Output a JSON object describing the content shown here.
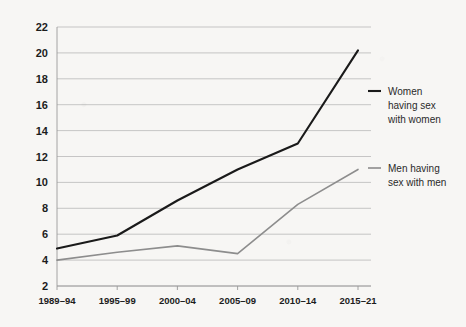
{
  "chart_data": {
    "type": "line",
    "title": "",
    "subtitle": "",
    "xlabel": "",
    "ylabel": "",
    "categories": [
      "1989–94",
      "1995–99",
      "2000–04",
      "2005–09",
      "2010–14",
      "2015–21"
    ],
    "ylim": [
      2,
      22
    ],
    "yticks": [
      2,
      4,
      6,
      8,
      10,
      12,
      14,
      16,
      18,
      20,
      22
    ],
    "ytick_labels": [
      "2",
      "4",
      "6",
      "8",
      "10",
      "12",
      "14",
      "16",
      "18",
      "20",
      "22"
    ],
    "grid": "horizontal",
    "legend_position": "right",
    "series": [
      {
        "name": "Women having sex with women",
        "legend_lines": [
          "Women",
          "having sex",
          "with women"
        ],
        "color": "#1a1a1a",
        "width": 2.1,
        "values": [
          4.9,
          5.9,
          8.6,
          11.0,
          13.0,
          20.2
        ]
      },
      {
        "name": "Men having sex with men",
        "legend_lines": [
          "Men having",
          "sex with men"
        ],
        "color": "#8d8d8d",
        "width": 1.6,
        "values": [
          4.0,
          4.6,
          5.1,
          4.5,
          8.3,
          11.0
        ]
      }
    ]
  },
  "colors": {
    "background": "#f7f6f4",
    "gridline": "#b9b9b9",
    "axis": "#9a9a9a",
    "text": "#1c1c1c",
    "legend_text": "#2a2a2a"
  }
}
